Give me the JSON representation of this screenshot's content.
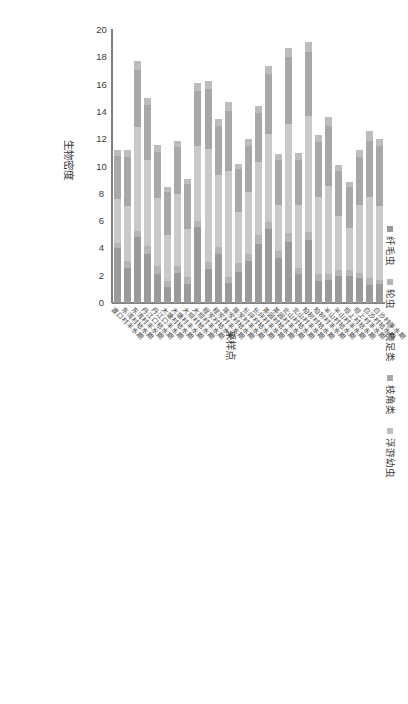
{
  "chart_data": {
    "type": "bar",
    "orientation": "horizontal-stacked",
    "title": "",
    "xlabel": "生物密度",
    "ylabel": "采样点",
    "xlim": [
      0,
      20
    ],
    "xticks": [
      0,
      2,
      4,
      6,
      8,
      10,
      12,
      14,
      16,
      18,
      20
    ],
    "grid": false,
    "legend_position": "top",
    "series": [
      {
        "name": "纤毛虫",
        "color": "#9a9a9a",
        "values": [
          1.4,
          1.3,
          1.8,
          2.0,
          2.0,
          1.7,
          1.6,
          4.6,
          2.1,
          4.5,
          3.3,
          5.4,
          4.3,
          3.1,
          2.3,
          1.5,
          3.6,
          2.5,
          5.6,
          1.4,
          2.2,
          1.2,
          2.1,
          3.6,
          4.8,
          2.6,
          4.0
        ]
      },
      {
        "name": "轮虫",
        "color": "#b5b5b5",
        "values": [
          0.3,
          0.5,
          0.4,
          0.4,
          0.4,
          0.4,
          0.5,
          0.6,
          0.5,
          0.6,
          0.5,
          0.5,
          0.7,
          0.5,
          0.6,
          0.4,
          0.5,
          0.5,
          0.4,
          0.5,
          0.5,
          0.4,
          0.6,
          0.6,
          0.5,
          0.5,
          0.4
        ]
      },
      {
        "name": "桡足类",
        "color": "#c9c9c9",
        "values": [
          5.4,
          6.0,
          5.0,
          3.1,
          4.0,
          6.5,
          5.7,
          8.5,
          4.6,
          8.0,
          3.4,
          6.5,
          5.3,
          4.5,
          3.8,
          7.8,
          5.3,
          8.3,
          5.5,
          3.5,
          5.3,
          3.4,
          5.0,
          6.3,
          7.6,
          4.0,
          3.2
        ]
      },
      {
        "name": "枝角类",
        "color": "#a8a8a8",
        "values": [
          4.4,
          4.1,
          3.5,
          3.0,
          3.3,
          4.4,
          4.0,
          4.7,
          3.3,
          4.9,
          3.3,
          4.4,
          3.6,
          3.4,
          3.1,
          4.4,
          3.6,
          4.4,
          4.0,
          3.3,
          3.4,
          3.1,
          3.4,
          4.0,
          4.2,
          3.6,
          3.2
        ]
      },
      {
        "name": "浮游幼虫",
        "color": "#bdbdbd",
        "values": [
          0.5,
          0.7,
          0.5,
          0.4,
          0.4,
          0.6,
          0.5,
          0.7,
          0.5,
          0.7,
          0.4,
          0.6,
          0.5,
          0.5,
          0.4,
          0.6,
          0.5,
          0.6,
          0.6,
          0.4,
          0.5,
          0.4,
          0.5,
          0.5,
          0.6,
          0.5,
          0.4
        ]
      }
    ],
    "categories": [
      "白沙村丰水期",
      "白沙村枯水期",
      "坝上村丰水期",
      "坝上村枯水期",
      "半山村丰水期",
      "半山村枯水期",
      "柏树村丰水期",
      "柏树村枯水期",
      "北山村丰水期",
      "北山村枯水期",
      "茶园村丰水期",
      "茶园村枯水期",
      "长坪村丰水期",
      "长坪村枯水期",
      "陈家村丰水期",
      "陈家村枯水期",
      "程家村丰水期",
      "程家村枯水期",
      "大坝村丰水期",
      "大坝村枯水期",
      "大塘村丰水期",
      "大塘村枯水期",
      "丹江口丰水期",
      "丹江口枯水期",
      "东湾村丰水期",
      "东湾村枯水期",
      "渡口村丰水期"
    ]
  },
  "axis": {
    "value_title": "生物密度",
    "category_title": "采样点"
  }
}
